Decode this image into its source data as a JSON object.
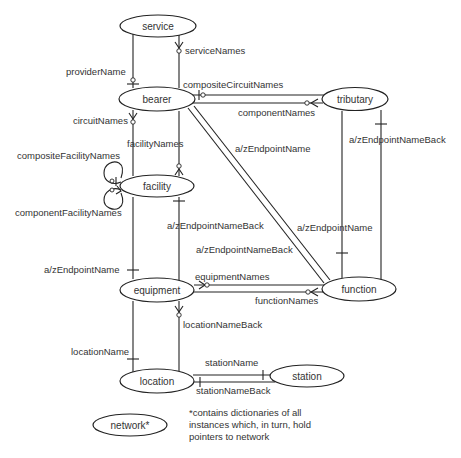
{
  "nodes": {
    "service": "service",
    "bearer": "bearer",
    "tributary": "tributary",
    "facility": "facility",
    "equipment": "equipment",
    "function": "function",
    "location": "location",
    "station": "station",
    "network": "network*"
  },
  "edges": {
    "providerName": "providerName",
    "serviceNames": "serviceNames",
    "compositeCircuitNames": "compositeCircuitNames",
    "componentNames": "componentNames",
    "circuitNames": "circuitNames",
    "facilityNames": "facilityNames",
    "bearer_function_azEndpointName": "a/zEndpointName",
    "tributary_azEndpointNameBack": "a/zEndpointNameBack",
    "compositeFacilityNames": "compositeFacilityNames",
    "componentFacilityNames": "componentFacilityNames",
    "facility_azEndpointNameBack": "a/zEndpointNameBack",
    "function_azEndpointName": "a/zEndpointName",
    "bearer_function_azEndpointNameBack": "a/zEndpointNameBack",
    "equipment_azEndpointName": "a/zEndpointName",
    "equipmentNames": "equipmentNames",
    "functionNames": "functionNames",
    "locationNameBack": "locationNameBack",
    "locationName": "locationName",
    "stationName": "stationName",
    "stationNameBack": "stationNameBack"
  },
  "note": {
    "line1": "*contains dictionaries of all",
    "line2": "instances which, in turn, hold",
    "line3": "pointers to network"
  }
}
